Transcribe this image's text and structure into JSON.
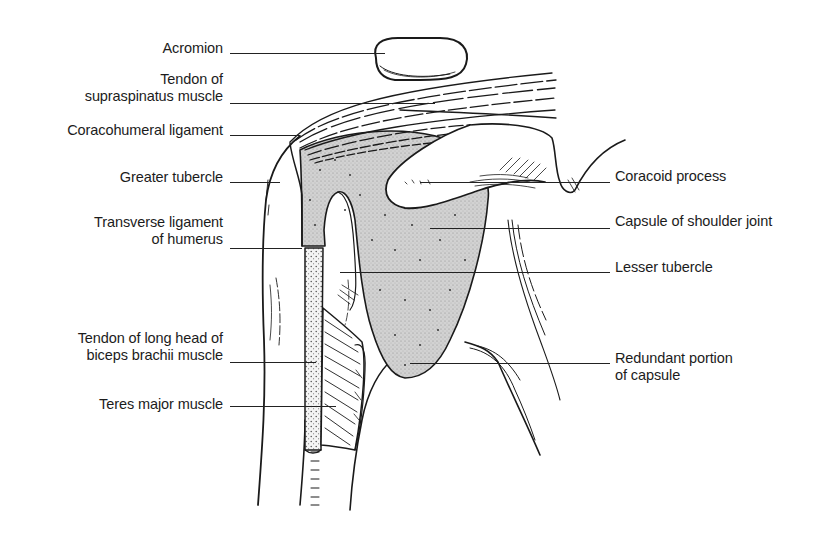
{
  "figure": {
    "ink_color": "#1a1a1a",
    "capsule_fill": "#c8c8c8",
    "background": "#ffffff"
  },
  "labels": {
    "left": [
      {
        "id": "acromion",
        "lines": [
          "Acromion"
        ],
        "right": 223,
        "top": 40,
        "leader": {
          "x1": 230,
          "x2": 385,
          "y": 53
        }
      },
      {
        "id": "supraspinatus",
        "lines": [
          "Tendon of",
          "supraspinatus muscle"
        ],
        "right": 223,
        "top": 71,
        "leader": {
          "x1": 230,
          "x2": 435,
          "y": 103
        }
      },
      {
        "id": "coracohumeral",
        "lines": [
          "Coracohumeral ligament"
        ],
        "right": 223,
        "top": 122,
        "leader": {
          "x1": 230,
          "x2": 300,
          "y": 135
        }
      },
      {
        "id": "greater-tubercle",
        "lines": [
          "Greater tubercle"
        ],
        "right": 223,
        "top": 169,
        "leader": {
          "x1": 230,
          "x2": 280,
          "y": 182
        }
      },
      {
        "id": "transverse-ligament",
        "lines": [
          "Transverse ligament",
          "of humerus"
        ],
        "right": 223,
        "top": 214,
        "leader": {
          "x1": 230,
          "x2": 302,
          "y": 248
        }
      },
      {
        "id": "biceps-tendon",
        "lines": [
          "Tendon of long head of",
          "biceps brachii muscle"
        ],
        "right": 223,
        "top": 330,
        "leader": {
          "x1": 230,
          "x2": 316,
          "y": 362
        }
      },
      {
        "id": "teres-major",
        "lines": [
          "Teres major muscle"
        ],
        "right": 223,
        "top": 396,
        "leader": {
          "x1": 230,
          "x2": 336,
          "y": 406
        }
      }
    ],
    "right": [
      {
        "id": "coracoid-process",
        "lines": [
          "Coracoid process"
        ],
        "left": 615,
        "top": 168,
        "leader": {
          "x1": 420,
          "x2": 610,
          "y": 182
        }
      },
      {
        "id": "capsule",
        "lines": [
          "Capsule of shoulder joint"
        ],
        "left": 615,
        "top": 213,
        "leader": {
          "x1": 430,
          "x2": 610,
          "y": 228
        }
      },
      {
        "id": "lesser-tubercle",
        "lines": [
          "Lesser tubercle"
        ],
        "left": 615,
        "top": 259,
        "leader": {
          "x1": 340,
          "x2": 610,
          "y": 272
        }
      },
      {
        "id": "redundant-capsule",
        "lines": [
          "Redundant portion",
          "of capsule"
        ],
        "left": 615,
        "top": 350,
        "leader": {
          "x1": 410,
          "x2": 610,
          "y": 363
        }
      }
    ]
  }
}
